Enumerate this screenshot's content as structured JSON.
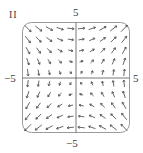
{
  "figure": {
    "panel_label": "II",
    "ticks": {
      "top": "5",
      "bottom": "−5",
      "left": "−5",
      "right": "5"
    },
    "field_formula": "F(x, y) = (y, x)",
    "grid": {
      "xmin": -5,
      "xmax": 5,
      "ymin": -5,
      "ymax": 5,
      "n": 10
    },
    "colors": {
      "arrow": "#555555",
      "frame": "#9a9a9a",
      "axis": "#555555"
    }
  }
}
